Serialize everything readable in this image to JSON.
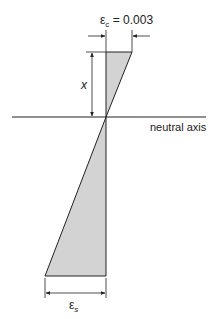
{
  "diagram": {
    "labels": {
      "epsilon_c_symbol": "ε",
      "epsilon_c_sub": "c",
      "epsilon_c_value": " = 0.003",
      "x_label": "x",
      "neutral_axis": "neutral axis",
      "epsilon_s_symbol": "ε",
      "epsilon_s_sub": "s"
    },
    "colors": {
      "fill": "#d3d3d3",
      "stroke": "#222222"
    }
  }
}
